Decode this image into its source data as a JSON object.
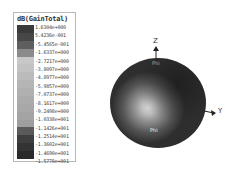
{
  "legend": {
    "title": "dB(GainTotal)",
    "entries": [
      {
        "label": "1.6304e+000",
        "color": "#3a3a3a"
      },
      {
        "label": "5.4236e-001",
        "color": "#474747"
      },
      {
        "label": "-5.4565e-001",
        "color": "#5e5e5e"
      },
      {
        "label": "-1.6337e+000",
        "color": "#8a8a8a"
      },
      {
        "label": "-2.7217e+000",
        "color": "#c8c8c8"
      },
      {
        "label": "-3.8097e+000",
        "color": "#c2c2c2"
      },
      {
        "label": "-4.8977e+000",
        "color": "#bbbbbb"
      },
      {
        "label": "-5.9857e+000",
        "color": "#b5b5b5"
      },
      {
        "label": "-7.0737e+000",
        "color": "#b0b0b0"
      },
      {
        "label": "-8.1617e+000",
        "color": "#ababab"
      },
      {
        "label": "-9.2498e+000",
        "color": "#a8a8a8"
      },
      {
        "label": "-1.0338e+001",
        "color": "#a4a4a4"
      },
      {
        "label": "-1.1426e+001",
        "color": "#9e9e9e"
      },
      {
        "label": "-1.2514e+001",
        "color": "#5a5a5a"
      },
      {
        "label": "-1.3602e+001",
        "color": "#3e3e3e"
      },
      {
        "label": "-1.4690e+001",
        "color": "#333333"
      },
      {
        "label": "-1.5778e+001",
        "color": "#2a2a2a"
      }
    ]
  },
  "plot": {
    "axis_z": "Z",
    "axis_y": "Y",
    "phi_label_top": "Phi",
    "phi_label_bottom": "Phi"
  }
}
